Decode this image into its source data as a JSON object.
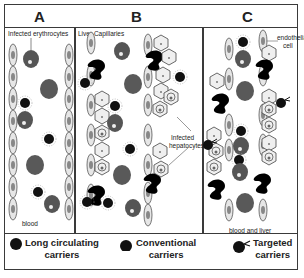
{
  "panels": [
    {
      "letter": "A",
      "label": "Infected erythrocytes",
      "bottom_label": "blood"
    },
    {
      "letter": "B",
      "label": "Liver Capillaries",
      "annotation": "Infected hepatocytes"
    },
    {
      "letter": "C",
      "label": "endothelial cell",
      "bottom_label": "blood and liver"
    }
  ],
  "annotations": {
    "a_top": "Infected erythrocytes",
    "a_bottom": "blood",
    "b_top": "Liver Capillaries",
    "b_infected_1": "Infected",
    "b_infected_2": "hepatocytes",
    "c_endo_1": "endothelial",
    "c_endo_2": "cell",
    "c_bottom": "blood and liver"
  },
  "legend": [
    {
      "icon": "long-circulating-carrier-icon",
      "line1": "Long circulating",
      "line2": "carriers"
    },
    {
      "icon": "conventional-carrier-icon",
      "line1": "Conventional",
      "line2": "carriers"
    },
    {
      "icon": "targeted-carrier-icon",
      "line1": "Targeted",
      "line2": "carriers"
    }
  ],
  "colors": {
    "border": "#3a3a3a",
    "erythrocyte": "#6b6b6b",
    "carrier": "#111111",
    "endothelial": "#d9d9d9",
    "hepatocyte": "#eeeeee",
    "kupffer": "#000000"
  }
}
